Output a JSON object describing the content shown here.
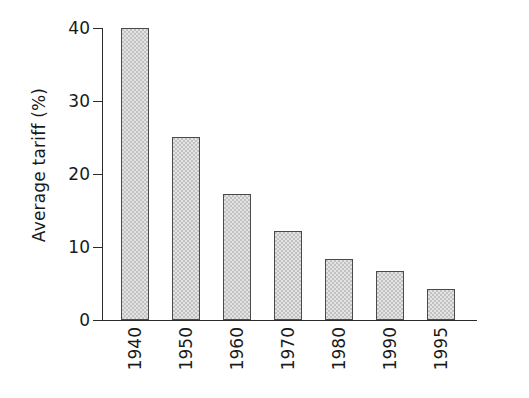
{
  "chart_data": {
    "type": "bar",
    "title": "",
    "xlabel": "",
    "ylabel": "Average tariff (%)",
    "categories": [
      "1940",
      "1950",
      "1960",
      "1970",
      "1980",
      "1990",
      "1995"
    ],
    "values": [
      40.0,
      25.1,
      17.2,
      12.2,
      8.3,
      6.7,
      4.2
    ],
    "ylim": [
      0,
      40
    ],
    "yticks": [
      0,
      10,
      20,
      30,
      40
    ],
    "ytick_labels": [
      "0",
      "10",
      "20",
      "30",
      "40"
    ],
    "grid": false,
    "legend": null,
    "bar_color": "#c2c2c2",
    "bar_edge_color": "#4a4a4a",
    "bar_hatch": "cross-hatch-texture",
    "axis_color": "#2b2b2b",
    "background_color": "#ffffff",
    "xtick_label_rotation": 90
  },
  "axes": {
    "y_title": "Average tariff (%)",
    "y_tick_0": "0",
    "y_tick_1": "10",
    "y_tick_2": "20",
    "y_tick_3": "30",
    "y_tick_4": "40",
    "x_tick_0": "1940",
    "x_tick_1": "1950",
    "x_tick_2": "1960",
    "x_tick_3": "1970",
    "x_tick_4": "1980",
    "x_tick_5": "1990",
    "x_tick_6": "1995"
  }
}
